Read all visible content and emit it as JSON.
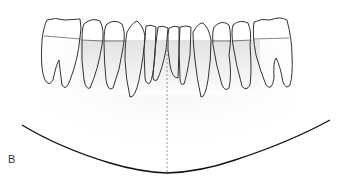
{
  "figure": {
    "panel_label": "B",
    "colors": {
      "outline": "#333333",
      "shading": "#e4e4e4",
      "midline": "#888888",
      "arch": "#111111"
    },
    "teeth_count": 12
  }
}
